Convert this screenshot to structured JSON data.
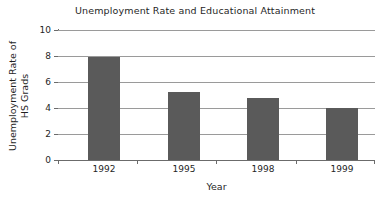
{
  "chart_data": {
    "type": "bar",
    "title": "Unemployment Rate and Educational Attainment",
    "xlabel": "Year",
    "ylabel": "Unemployment Rate of HS Grads",
    "ylabel_lines": [
      "Unemployment Rate of",
      "HS Grads"
    ],
    "categories": [
      "1992",
      "1995",
      "1998",
      "1999"
    ],
    "values": [
      7.9,
      5.2,
      4.8,
      4.0
    ],
    "ylim": [
      0,
      10
    ],
    "yticks": [
      0,
      2,
      4,
      6,
      8,
      10
    ],
    "ytick_labels": [
      "0",
      "2",
      "4",
      "6",
      "8",
      "10"
    ],
    "grid": true,
    "grid_axis": "y",
    "legend": false,
    "legend_position": "none",
    "colors": {
      "bar": "#5a5a5a",
      "gridline": "#9a9a9a",
      "axis": "#6b6b6b",
      "text": "#1f1f1f",
      "background": "#ffffff"
    }
  }
}
